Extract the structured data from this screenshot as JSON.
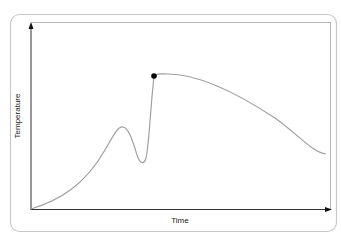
{
  "diagram": {
    "x_axis_label": "Time",
    "y_axis_label": "Temperature",
    "colors": {
      "frame": "#c8c8c8",
      "axis": "#333333",
      "curve": "#a0a0a0",
      "marker": "#000000"
    },
    "curve_description": "Temperature rises gradually, forms a local peak, dips to a trough, then rises sharply to a marked maximum point, followed by a slow decline toward the end.",
    "marked_point": "maximum"
  }
}
